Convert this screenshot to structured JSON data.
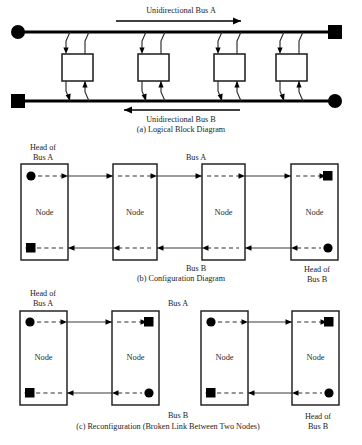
{
  "figure": {
    "panels": [
      {
        "id": "a",
        "caption": "(a) Logical Block Diagram",
        "bus_a_label": "Unidirectional Bus A",
        "bus_b_label": "Unidirectional Bus B",
        "bus_a_direction": "right",
        "bus_b_direction": "left",
        "node_count": 4,
        "nodes": [
          {
            "label": ""
          },
          {
            "label": ""
          },
          {
            "label": ""
          },
          {
            "label": ""
          }
        ],
        "terminators": {
          "top_left": "circle",
          "top_right": "square",
          "bottom_left": "square",
          "bottom_right": "circle"
        }
      },
      {
        "id": "b",
        "caption": "(b) Configuration Diagram",
        "bus_a_label": "Bus A",
        "bus_b_label": "Bus B",
        "head_a_label": "Head of\nBus A",
        "head_a_line1": "Head of",
        "head_a_line2": "Bus A",
        "head_b_line1": "Head of",
        "head_b_line2": "Bus B",
        "node_label": "Node",
        "node_count": 4,
        "nodes": [
          {
            "label": "Node",
            "top_marker": "circle",
            "bottom_marker": "square"
          },
          {
            "label": "Node",
            "top_marker": "none",
            "bottom_marker": "none"
          },
          {
            "label": "Node",
            "top_marker": "none",
            "bottom_marker": "none"
          },
          {
            "label": "Node",
            "top_marker": "square",
            "bottom_marker": "circle"
          }
        ]
      },
      {
        "id": "c",
        "caption": "(c) Reconfiguration (Broken Link Between Two Nodes)",
        "bus_a_label": "Bus A",
        "bus_b_label": "Bus B",
        "head_a_line1": "Head of",
        "head_a_line2": "Bus A",
        "head_b_line1": "Head of",
        "head_b_line2": "Bus B",
        "node_label": "Node",
        "node_count": 4,
        "broken_link_between": [
          2,
          3
        ],
        "segments": [
          {
            "nodes": [
              {
                "label": "Node",
                "top_marker": "circle",
                "bottom_marker": "square"
              },
              {
                "label": "Node",
                "top_marker": "square",
                "bottom_marker": "circle"
              }
            ]
          },
          {
            "nodes": [
              {
                "label": "Node",
                "top_marker": "circle",
                "bottom_marker": "square"
              },
              {
                "label": "Node",
                "top_marker": "square",
                "bottom_marker": "circle"
              }
            ]
          }
        ]
      }
    ],
    "colors": {
      "ink": "#000000",
      "line": "#2e2e2e",
      "background": "#ffffff"
    }
  }
}
